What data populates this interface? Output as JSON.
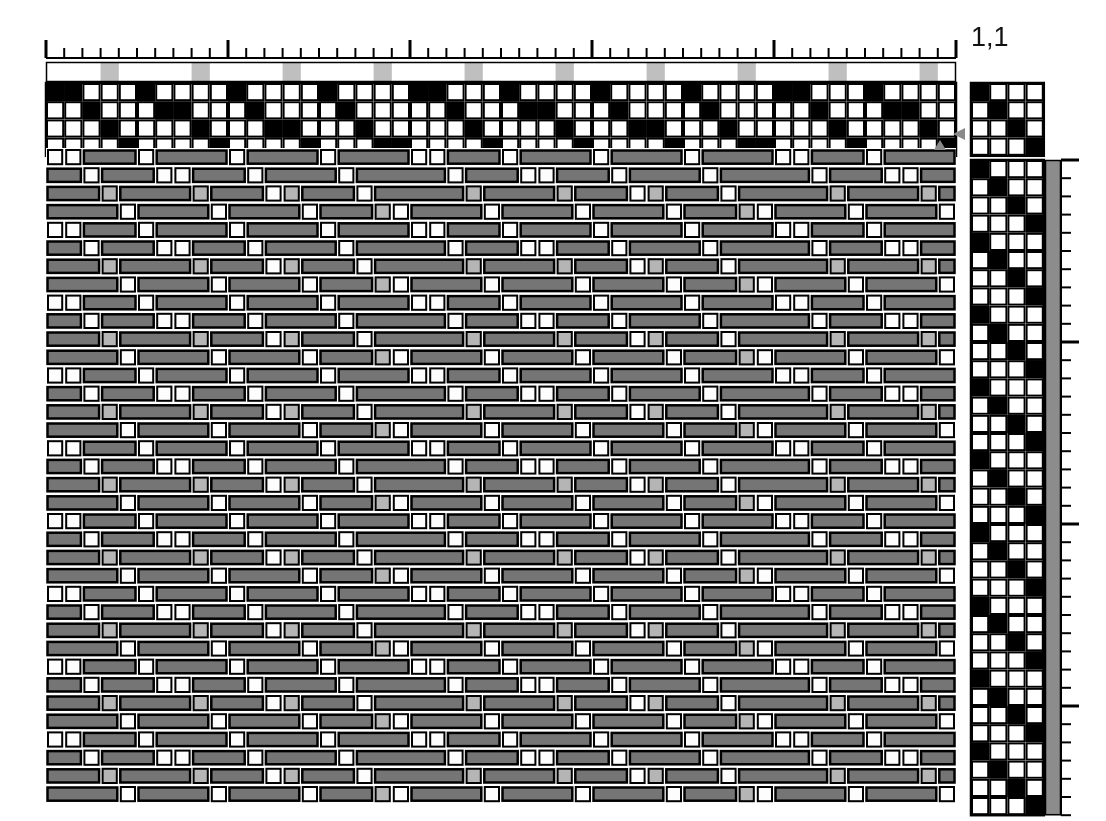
{
  "document": {
    "kind": "weaving-draft",
    "title": "",
    "repeat_label": "1,1"
  },
  "colors": {
    "background": "#ffffff",
    "grid_line": "#000000",
    "filled_cell": "#000000",
    "empty_cell": "#ffffff",
    "warp_accent": "#bfbfbf",
    "weft_bar": "#8c8c8c",
    "cloth_warp_float": "#757575",
    "cloth_weft_white": "#fdfdfd",
    "cloth_weft_accent": "#b5b5b5",
    "cloth_outline": "#000000",
    "marker_triangle": "#8a8a8a",
    "ruler_tick": "#000000"
  },
  "layout": {
    "canvas_width": 1106,
    "canvas_height": 821,
    "cell": 18.2,
    "threading_left": 46,
    "threading_top": 83,
    "shafts": 4,
    "ends": 50,
    "drawdown_top": 148,
    "picks": 36,
    "tieup_left": 971,
    "tieup_top": 83,
    "treadles": 4,
    "treadling_left": 971,
    "treadling_top": 160,
    "weftbar_left": 1045,
    "ruler_top": 40,
    "warpbar_top": 62
  },
  "ruler": {
    "name": "top-ruler",
    "tick_interval_ends": 1,
    "major_tick_every": 10,
    "minor_tick_height": 10,
    "major_tick_height": 18,
    "right_ruler_major_every": 10
  },
  "warp_color_bar": {
    "name": "warp-color-bar",
    "description": "Warp end colours, left to right",
    "pattern_repeat": 5,
    "accent_offset": 3,
    "colors": [
      "white",
      "white",
      "white",
      "accent",
      "white"
    ]
  },
  "threading": {
    "name": "threading-draft",
    "shaft_count": 4,
    "description": "Shaft assignment for each warp end, read bottom shaft 1 to top shaft 4",
    "repeat": [
      4,
      4,
      3,
      2,
      1,
      4,
      3,
      3,
      2,
      1,
      4,
      3,
      2,
      2,
      1,
      4,
      3,
      2,
      1,
      1
    ],
    "sequence": [
      4,
      4,
      3,
      2,
      1,
      4,
      3,
      3,
      2,
      1,
      4,
      3,
      2,
      2,
      1,
      4,
      3,
      2,
      1,
      1,
      4,
      4,
      3,
      2,
      1,
      4,
      3,
      3,
      2,
      1,
      4,
      3,
      2,
      2,
      1,
      4,
      3,
      2,
      1,
      1,
      4,
      4,
      3,
      2,
      1,
      4,
      3,
      3,
      2,
      1
    ]
  },
  "tieup": {
    "name": "tie-up",
    "rows": 4,
    "cols": 4,
    "description": "Treadle to shaft tie-up, 1 = tied",
    "matrix": [
      [
        1,
        0,
        0,
        0
      ],
      [
        0,
        1,
        0,
        0
      ],
      [
        0,
        0,
        1,
        0
      ],
      [
        0,
        0,
        0,
        1
      ]
    ]
  },
  "treadling": {
    "name": "treadling-draft",
    "treadle_count": 4,
    "description": "Treadle pressed for each pick, top to bottom",
    "repeat": [
      1,
      2,
      3,
      4
    ],
    "pick_count": 36
  },
  "weft_color_bar": {
    "name": "weft-color-bar",
    "description": "Weft colour for every pick (solid mid grey)",
    "color": "weft_bar"
  },
  "drawdown": {
    "name": "drawdown",
    "description": "Interlacement, warp floats shown as dark grey blocks over light weft",
    "ends": 50,
    "picks": 36,
    "weave_structure": "3/1 broken twill",
    "warp_up_threshold": 3
  },
  "markers": [
    {
      "name": "repeat-marker-threading",
      "x": 953,
      "y": 134,
      "direction": "left"
    },
    {
      "name": "repeat-marker-drawdown",
      "x": 940,
      "y": 140,
      "direction": "up"
    }
  ]
}
